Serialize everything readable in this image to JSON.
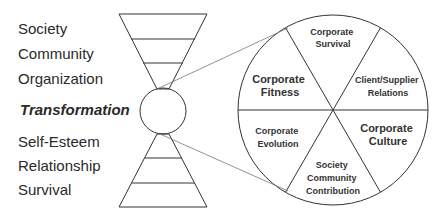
{
  "left_labels": {
    "upper": [
      "Society",
      "Community",
      "Organization"
    ],
    "center": "Transformation",
    "lower": [
      "Self-Esteem",
      "Relationship",
      "Survival"
    ]
  },
  "wheel": {
    "segments": [
      {
        "id": "top",
        "lines": [
          "Corporate",
          "Survival"
        ],
        "size": 9
      },
      {
        "id": "upper-right",
        "lines": [
          "Client/Supplier",
          "Relations"
        ],
        "size": 9
      },
      {
        "id": "lower-right",
        "lines": [
          "Corporate",
          "Culture"
        ],
        "size": 11
      },
      {
        "id": "bottom",
        "lines": [
          "Society",
          "Community",
          "Contribution"
        ],
        "size": 9
      },
      {
        "id": "lower-left",
        "lines": [
          "Corporate",
          "Evolution"
        ],
        "size": 9
      },
      {
        "id": "upper-left",
        "lines": [
          "Corporate",
          "Fitness"
        ],
        "size": 11
      }
    ]
  },
  "colors": {
    "line": "#333333",
    "connector": "#777777",
    "text": "#2a2a2a"
  }
}
